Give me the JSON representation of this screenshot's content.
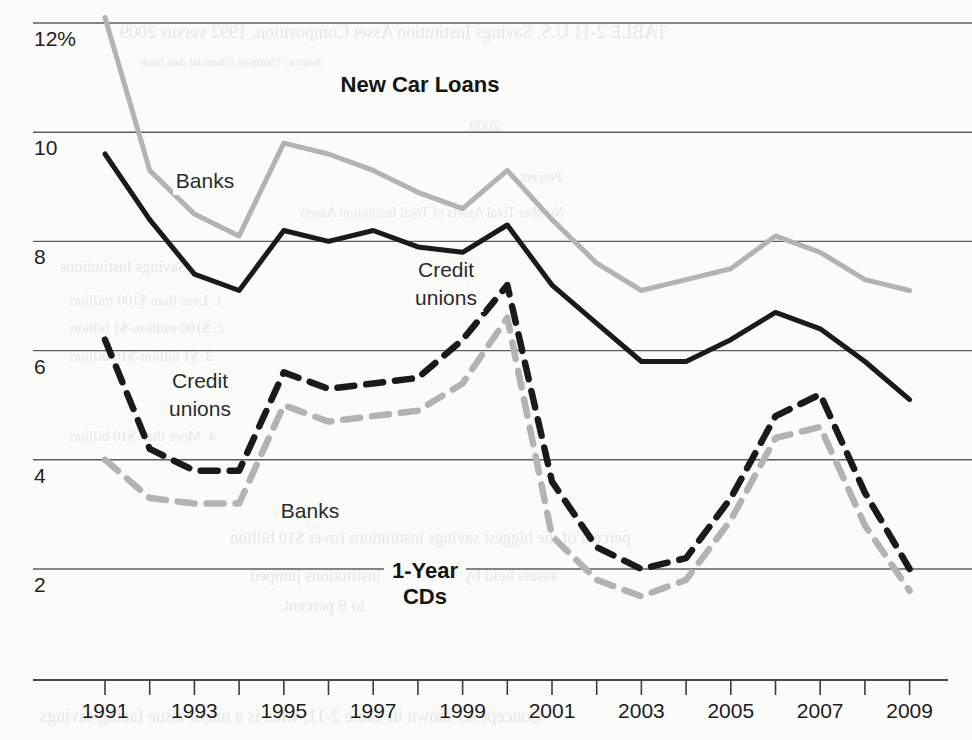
{
  "figure": {
    "background_color": "#fbfbfa",
    "panel_titles": {
      "top": "New Car Loans",
      "bottom_line1": "1-Year",
      "bottom_line2": "CDs"
    },
    "inline_labels": {
      "loans_banks": "Banks",
      "loans_credit_unions_line1": "Credit",
      "loans_credit_unions_line2": "unions",
      "cds_credit_unions_line1": "Credit",
      "cds_credit_unions_line2": "unions",
      "cds_banks": "Banks"
    },
    "colors": {
      "banks": "#b3b3b3",
      "credit_unions": "#1a1a1a",
      "gridline": "#5d5d5d",
      "axis": "#4a4a4a",
      "text": "#1d1d1d"
    },
    "ghost_text": [
      {
        "text": "TABLE 2-11   U.S. Savings Institution Asset Composition, 1992 versus 2009",
        "x": 120,
        "y": 22,
        "size": 18
      },
      {
        "text": "Source: Thomson Financial data bank",
        "x": 140,
        "y": 55,
        "size": 12
      },
      {
        "text": "2009",
        "x": 470,
        "y": 118,
        "size": 15
      },
      {
        "text": "Percent",
        "x": 520,
        "y": 170,
        "size": 14
      },
      {
        "text": "Number     Total Assets    of Total Institution Assets",
        "x": 300,
        "y": 205,
        "size": 14
      },
      {
        "text": "Savings Institutions",
        "x": 60,
        "y": 258,
        "size": 16
      },
      {
        "text": "1. Less than $100 million",
        "x": 70,
        "y": 292,
        "size": 15
      },
      {
        "text": "2. $100 million-$1 billion",
        "x": 70,
        "y": 320,
        "size": 15
      },
      {
        "text": "3. $1 billion-$10 billion",
        "x": 70,
        "y": 348,
        "size": 15
      },
      {
        "text": "4. More than $10 billion",
        "x": 70,
        "y": 428,
        "size": 15
      },
      {
        "text": "percent of the biggest savings institutions (over $10 billion",
        "x": 230,
        "y": 528,
        "size": 17
      },
      {
        "text": "assets held by the biggest institutions jumped",
        "x": 250,
        "y": 566,
        "size": 17
      },
      {
        "text": "to 6 percent.",
        "x": 280,
        "y": 596,
        "size": 17
      },
      {
        "text": "Concept    As shown in Table 2-11, what is a major issue facing savings",
        "x": 40,
        "y": 706,
        "size": 18
      }
    ]
  },
  "chart_data": {
    "type": "line",
    "xlabel": "",
    "ylabel": "",
    "ylim": [
      1.0,
      12.6
    ],
    "xlim": [
      1990.5,
      2009.6
    ],
    "grid": true,
    "legend_position": "inline-annotations",
    "y_tick_labels": [
      "12%",
      "10",
      "8",
      "6",
      "4",
      "2"
    ],
    "y_ticks": [
      12,
      10,
      8,
      6,
      4,
      2
    ],
    "x_tick_labels": [
      "1991",
      "1993",
      "1995",
      "1997",
      "1999",
      "2001",
      "2003",
      "2005",
      "2007",
      "2009"
    ],
    "x_ticks_all": [
      1991,
      1992,
      1993,
      1994,
      1995,
      1996,
      1997,
      1998,
      1999,
      2000,
      2001,
      2002,
      2003,
      2004,
      2005,
      2006,
      2007,
      2008,
      2009
    ],
    "x": [
      1991,
      1992,
      1993,
      1994,
      1995,
      1996,
      1997,
      1998,
      1999,
      2000,
      2001,
      2002,
      2003,
      2004,
      2005,
      2006,
      2007,
      2008,
      2009
    ],
    "series": [
      {
        "name": "New Car Loans — Banks",
        "group": "New Car Loans",
        "institution": "Banks",
        "color": "#b3b3b3",
        "style": "solid",
        "values": [
          12.1,
          9.3,
          8.5,
          8.1,
          9.8,
          9.6,
          9.3,
          8.9,
          8.6,
          9.3,
          8.4,
          7.6,
          7.1,
          7.3,
          7.5,
          8.1,
          7.8,
          7.3,
          7.1
        ]
      },
      {
        "name": "New Car Loans — Credit unions",
        "group": "New Car Loans",
        "institution": "Credit unions",
        "color": "#1a1a1a",
        "style": "solid",
        "values": [
          9.6,
          8.4,
          7.4,
          7.1,
          8.2,
          8.0,
          8.2,
          7.9,
          7.8,
          8.3,
          7.2,
          6.5,
          5.8,
          5.8,
          6.2,
          6.7,
          6.4,
          5.8,
          5.1
        ]
      },
      {
        "name": "1-Year CDs — Credit unions",
        "group": "1-Year CDs",
        "institution": "Credit unions",
        "color": "#1a1a1a",
        "style": "dashed",
        "values": [
          6.2,
          4.2,
          3.8,
          3.8,
          5.6,
          5.3,
          5.4,
          5.5,
          6.2,
          7.2,
          3.6,
          2.4,
          2.0,
          2.2,
          3.3,
          4.8,
          5.2,
          3.4,
          2.0
        ]
      },
      {
        "name": "1-Year CDs — Banks",
        "group": "1-Year CDs",
        "institution": "Banks",
        "color": "#b3b3b3",
        "style": "dashed",
        "values": [
          4.0,
          3.3,
          3.2,
          3.2,
          5.0,
          4.7,
          4.8,
          4.9,
          5.4,
          6.6,
          2.6,
          1.8,
          1.5,
          1.8,
          2.9,
          4.4,
          4.6,
          2.8,
          1.6
        ]
      }
    ],
    "annotations": [
      {
        "text": "New Car Loans",
        "x": 1998.0,
        "y": 12.0,
        "role": "panel-title"
      },
      {
        "text": "Banks",
        "x": 1992.6,
        "y": 9.6,
        "role": "series-label"
      },
      {
        "text": "Credit unions",
        "x": 1998.0,
        "y": 7.2,
        "role": "series-label"
      },
      {
        "text": "Credit unions",
        "x": 1994.0,
        "y": 5.3,
        "role": "series-label"
      },
      {
        "text": "Banks",
        "x": 1997.3,
        "y": 3.5,
        "role": "series-label"
      },
      {
        "text": "1-Year CDs",
        "x": 1998.1,
        "y": 2.0,
        "role": "panel-title"
      }
    ]
  }
}
